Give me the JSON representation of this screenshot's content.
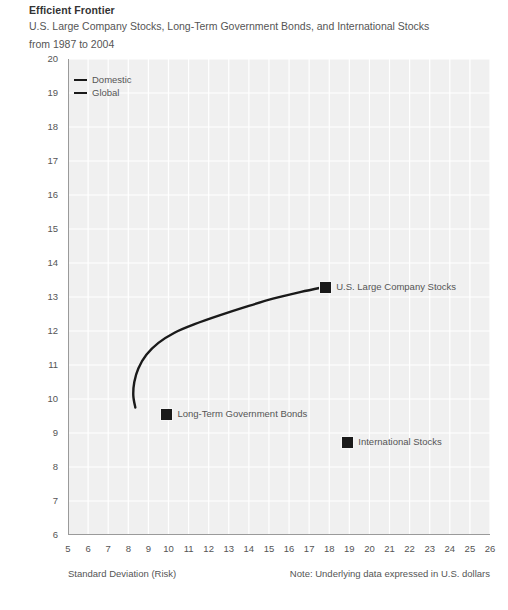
{
  "header": {
    "title": "Efficient Frontier",
    "subtitle": "U.S. Large Company Stocks, Long-Term Government Bonds, and International Stocks",
    "period": "from 1987 to 2004"
  },
  "footer": {
    "xtitle": "Standard Deviation (Risk)",
    "note": "Note: Underlying data expressed in U.S. dollars"
  },
  "chart_data": {
    "type": "line",
    "title": "Efficient Frontier",
    "subtitle": "U.S. Large Company Stocks, Long-Term Government Bonds, and International Stocks from 1987 to 2004",
    "xlabel": "Standard Deviation (Risk)",
    "ylabel": "Expected Return",
    "xlim": [
      5,
      26
    ],
    "ylim": [
      6,
      20
    ],
    "xticks": [
      5,
      6,
      7,
      8,
      9,
      10,
      11,
      12,
      13,
      14,
      15,
      16,
      17,
      18,
      19,
      20,
      21,
      22,
      23,
      24,
      25,
      26
    ],
    "yticks": [
      6,
      7,
      8,
      9,
      10,
      11,
      12,
      13,
      14,
      15,
      16,
      17,
      18,
      19,
      20
    ],
    "xtick_labels": [
      "5",
      "6",
      "7",
      "8",
      "9",
      "10",
      "11",
      "12",
      "13",
      "14",
      "15",
      "16",
      "17",
      "18",
      "19",
      "20",
      "21",
      "22",
      "23",
      "24",
      "25",
      "26"
    ],
    "ytick_labels": [
      "6",
      "7",
      "8",
      "9",
      "10",
      "11",
      "12",
      "13",
      "14",
      "15",
      "16",
      "17",
      "18",
      "19",
      "20"
    ],
    "grid": true,
    "minor_ticks": true,
    "legend_position": "top-left",
    "legend": [
      {
        "name": "Domestic",
        "color": "#1a1a1a"
      },
      {
        "name": "Global",
        "color": "#1a1a1a"
      }
    ],
    "series": [
      {
        "name": "Efficient Frontier curve",
        "color": "#1a1a1a",
        "points": [
          {
            "x": 8.35,
            "y": 9.75
          },
          {
            "x": 8.25,
            "y": 10.1
          },
          {
            "x": 8.3,
            "y": 10.5
          },
          {
            "x": 8.5,
            "y": 10.9
          },
          {
            "x": 8.9,
            "y": 11.3
          },
          {
            "x": 9.5,
            "y": 11.65
          },
          {
            "x": 10.3,
            "y": 11.95
          },
          {
            "x": 11.3,
            "y": 12.2
          },
          {
            "x": 12.5,
            "y": 12.45
          },
          {
            "x": 13.8,
            "y": 12.7
          },
          {
            "x": 15.2,
            "y": 12.95
          },
          {
            "x": 16.6,
            "y": 13.15
          },
          {
            "x": 17.8,
            "y": 13.3
          }
        ]
      }
    ],
    "markers": [
      {
        "label": "U.S. Large Company Stocks",
        "x": 17.8,
        "y": 13.3,
        "color": "#1a1a1a"
      },
      {
        "label": "Long-Term Government Bonds",
        "x": 9.9,
        "y": 9.55,
        "color": "#1a1a1a"
      },
      {
        "label": "International Stocks",
        "x": 18.9,
        "y": 8.75,
        "color": "#1a1a1a"
      }
    ]
  }
}
